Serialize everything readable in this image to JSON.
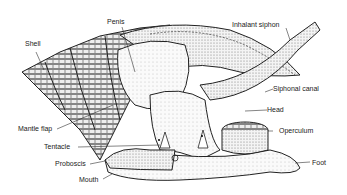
{
  "figure": {
    "labels": {
      "shell": "Shell",
      "penis": "Penis",
      "inhalant_siphon": "Inhalant siphon",
      "siphonal_canal": "Siphonal canal",
      "head": "Head",
      "operculum": "Operculum",
      "mantle_flap": "Mantle flap",
      "tentacle": "Tentacle",
      "proboscis": "Proboscis",
      "mouth": "Mouth",
      "foot": "Foot"
    }
  }
}
